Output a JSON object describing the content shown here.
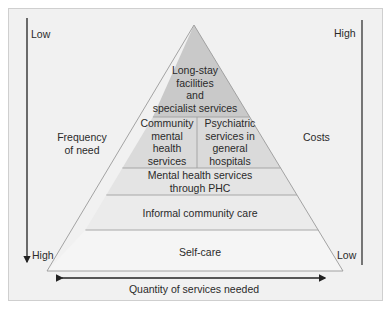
{
  "diagram": {
    "type": "pyramid",
    "layers": [
      {
        "id": "top",
        "lines": [
          "Long-stay",
          "facilities",
          "and",
          "specialist services"
        ],
        "fill": "#c9c9c9"
      },
      {
        "id": "community",
        "lines": [
          "Community",
          "mental",
          "health",
          "services"
        ],
        "fill": "#dadada"
      },
      {
        "id": "psychiatric",
        "lines": [
          "Psychiatric",
          "services in",
          "general",
          "hospitals"
        ],
        "fill": "#dadada"
      },
      {
        "id": "phc",
        "lines": [
          "Mental health services",
          "through PHC"
        ],
        "fill": "#e4e4e4"
      },
      {
        "id": "informal",
        "lines": [
          "Informal community care"
        ],
        "fill": "#ebebeb"
      },
      {
        "id": "selfcare",
        "lines": [
          "Self-care"
        ],
        "fill": "#f4f4f4"
      }
    ],
    "left_axis": {
      "label_lines": [
        "Frequency",
        "of need"
      ],
      "top": "Low",
      "bottom": "High"
    },
    "right_axis": {
      "label": "Costs",
      "top": "High",
      "bottom": "Low"
    },
    "bottom_axis": {
      "label": "Quantity of services needed"
    },
    "colors": {
      "background": "#f1f1f1",
      "line": "#555555",
      "edge": "#9a9a9a"
    }
  }
}
